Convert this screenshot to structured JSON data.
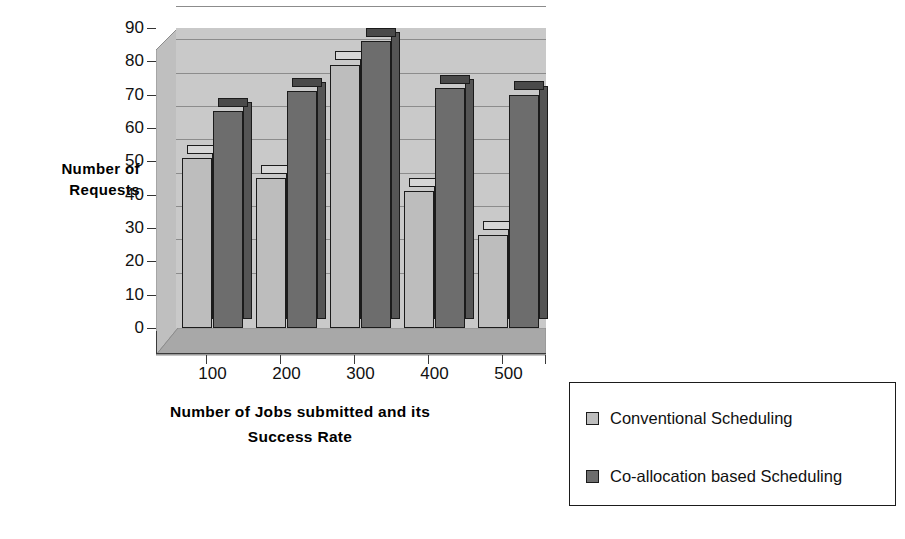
{
  "chart_data": {
    "type": "bar",
    "title": "",
    "xlabel": "Number of Jobs submitted and its Success Rate",
    "ylabel": "Number of Requests",
    "categories": [
      "100",
      "200",
      "300",
      "400",
      "500"
    ],
    "series": [
      {
        "name": "Conventional Scheduling",
        "values": [
          51,
          45,
          79,
          41,
          28
        ],
        "color": "#bdbdbd"
      },
      {
        "name": "Co-allocation based Scheduling",
        "values": [
          65,
          71,
          86,
          72,
          70
        ],
        "color": "#6d6d6d"
      }
    ],
    "ylim": [
      0,
      90
    ],
    "ytick_step": 10,
    "yticks": [
      "90",
      "80",
      "70",
      "60",
      "50",
      "40",
      "30",
      "20",
      "10",
      "0"
    ],
    "grid": true,
    "legend_position": "bottom-right",
    "style": "3d-column",
    "plot_background": "#c9c9c9"
  },
  "axis": {
    "y_title_line1": "Number of",
    "y_title_line2": "Requests",
    "x_title_line1": "Number of Jobs submitted and its",
    "x_title_line2": "Success Rate"
  }
}
